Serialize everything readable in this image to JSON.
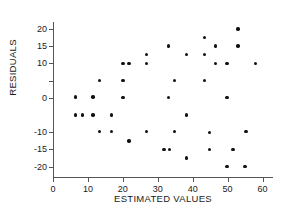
{
  "chart_data": {
    "type": "scatter",
    "title": "",
    "xlabel": "ESTIMATED VALUES",
    "ylabel": "RESIDUALS",
    "xlim": [
      0,
      63
    ],
    "ylim": [
      -23,
      22
    ],
    "grid": false,
    "legend": "none",
    "xticks": [
      0,
      10,
      20,
      30,
      40,
      50,
      60
    ],
    "xtick_labels": [
      "0",
      "10",
      "20",
      "30",
      "40",
      "50",
      "60"
    ],
    "yticks": [
      20,
      15,
      10,
      5,
      0,
      -10,
      -15,
      -20
    ],
    "ytick_labels": [
      "20",
      "15",
      "10",
      "",
      "0",
      "-10",
      "-15",
      "-20"
    ],
    "marker": "filled-circle",
    "marker_color": "#111111",
    "points": [
      {
        "x": 6.5,
        "y": 0.2
      },
      {
        "x": 6.5,
        "y": -5.0
      },
      {
        "x": 8.5,
        "y": -5.0
      },
      {
        "x": 11.5,
        "y": 0.2
      },
      {
        "x": 11.5,
        "y": -5.0
      },
      {
        "x": 13.3,
        "y": 5.0
      },
      {
        "x": 13.3,
        "y": -9.8
      },
      {
        "x": 16.8,
        "y": -5.0
      },
      {
        "x": 16.8,
        "y": -9.8
      },
      {
        "x": 20.0,
        "y": 10.0
      },
      {
        "x": 20.0,
        "y": 5.0
      },
      {
        "x": 20.0,
        "y": 0.0
      },
      {
        "x": 21.8,
        "y": 10.0
      },
      {
        "x": 21.8,
        "y": -12.5
      },
      {
        "x": 26.7,
        "y": 12.5
      },
      {
        "x": 26.7,
        "y": 10.0
      },
      {
        "x": 26.7,
        "y": -9.8
      },
      {
        "x": 31.8,
        "y": -15.0
      },
      {
        "x": 33.0,
        "y": 15.0
      },
      {
        "x": 33.0,
        "y": 0.0
      },
      {
        "x": 33.3,
        "y": -15.0
      },
      {
        "x": 34.8,
        "y": 5.0
      },
      {
        "x": 34.8,
        "y": -9.8
      },
      {
        "x": 38.3,
        "y": 12.5
      },
      {
        "x": 38.3,
        "y": -5.0
      },
      {
        "x": 38.3,
        "y": -17.5
      },
      {
        "x": 43.3,
        "y": 17.5
      },
      {
        "x": 43.3,
        "y": 12.5
      },
      {
        "x": 43.3,
        "y": 5.0
      },
      {
        "x": 44.8,
        "y": -10.0
      },
      {
        "x": 44.8,
        "y": -15.0
      },
      {
        "x": 46.5,
        "y": 15.0
      },
      {
        "x": 46.5,
        "y": 10.0
      },
      {
        "x": 49.8,
        "y": 10.0
      },
      {
        "x": 49.8,
        "y": 0.0
      },
      {
        "x": 49.8,
        "y": -20.0
      },
      {
        "x": 51.5,
        "y": -15.0
      },
      {
        "x": 53.0,
        "y": 20.0
      },
      {
        "x": 53.0,
        "y": 15.0
      },
      {
        "x": 55.0,
        "y": -20.0
      },
      {
        "x": 55.3,
        "y": -9.8
      },
      {
        "x": 58.0,
        "y": 10.0
      }
    ]
  }
}
